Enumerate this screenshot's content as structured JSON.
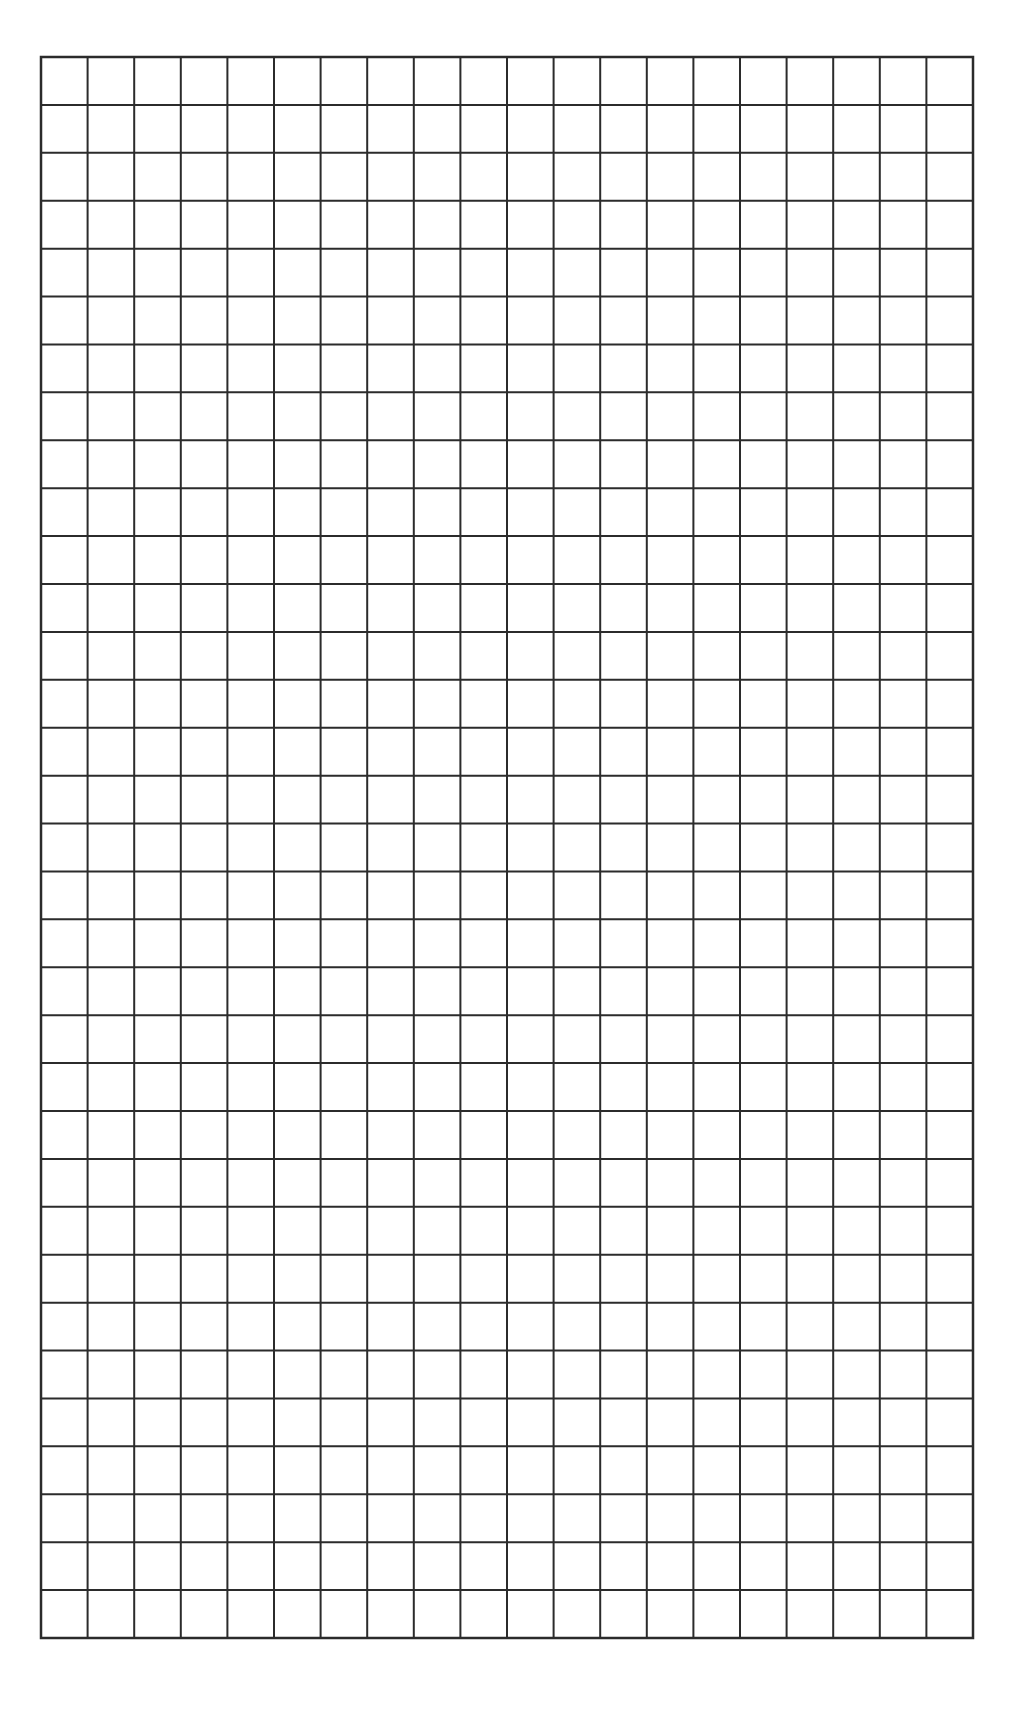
{
  "page": {
    "type": "blank-grid-paper",
    "background_color": "#ffffff"
  },
  "grid": {
    "columns": 20,
    "rows": 33,
    "left": 41,
    "top": 57,
    "right": 973,
    "bottom": 1638,
    "line_color": "#2b2b2b",
    "line_width": 2
  }
}
